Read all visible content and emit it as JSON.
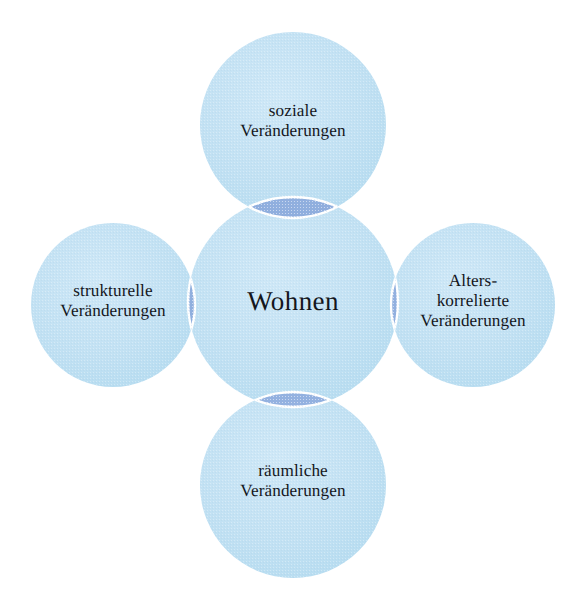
{
  "diagram": {
    "type": "venn-petal-diagram",
    "center": {
      "id": "wohnen",
      "label": "Wohnen",
      "lines": [
        "Wohnen"
      ]
    },
    "satellites": [
      {
        "id": "soziale",
        "position": "top",
        "lines": [
          "soziale",
          "Veränderungen"
        ]
      },
      {
        "id": "strukturelle",
        "position": "left",
        "lines": [
          "strukturelle",
          "Veränderungen"
        ]
      },
      {
        "id": "alterskorrelierte",
        "position": "right",
        "lines": [
          "Alters-",
          "korrelierte",
          "Veränderungen"
        ]
      },
      {
        "id": "raeumliche",
        "position": "bottom",
        "lines": [
          "räumliche",
          "Veränderungen"
        ]
      }
    ],
    "colors": {
      "background": "#ffffff",
      "circle_fill": "#bfdff2",
      "circle_fill_light": "#cfe8f7",
      "overlap_fill": "#93b1e0",
      "separator": "#ffffff",
      "text": "#14161c"
    },
    "geometry": {
      "center_circle": {
        "cx": 293,
        "cy": 302,
        "r": 105
      },
      "top_circle": {
        "cx": 293,
        "cy": 125,
        "r": 93
      },
      "bottom_circle": {
        "cx": 293,
        "cy": 485,
        "r": 93
      },
      "left_circle": {
        "cx": 113,
        "cy": 305,
        "r": 82
      },
      "right_circle": {
        "cx": 473,
        "cy": 305,
        "r": 82
      }
    }
  }
}
